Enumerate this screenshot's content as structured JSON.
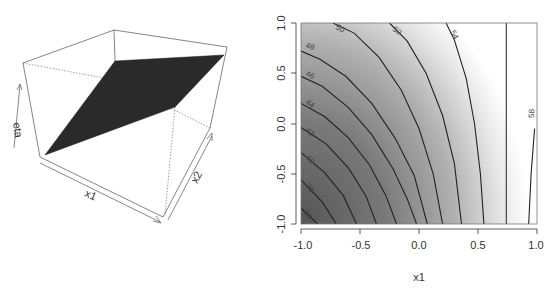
{
  "chart_data": [
    {
      "type": "surface3d",
      "title": "",
      "xlabel": "x1",
      "ylabel": "x2",
      "zlabel": "eta",
      "surface_color": "#2a2a2a",
      "description": "Planar surface eta over (x1, x2), perspective box view"
    },
    {
      "type": "contour",
      "title": "",
      "xlabel": "x1",
      "ylabel": "",
      "xlim": [
        -1.0,
        1.0
      ],
      "ylim": [
        -1.0,
        1.0
      ],
      "x_ticks": [
        "-1.0",
        "-0.5",
        "0.0",
        "0.5",
        "1.0"
      ],
      "y_ticks": [
        "-1.0",
        "-0.5",
        "0.0",
        "0.5",
        "1.0"
      ],
      "fill": "grayscale, dark (low) at bottom-left to white (high) toward right",
      "levels": [
        36,
        38,
        40,
        42,
        44,
        46,
        48,
        50,
        52,
        54,
        56,
        58
      ],
      "labeled_levels": [
        "36",
        "38",
        "40",
        "42",
        "44",
        "46",
        "48",
        "50",
        "52",
        "54",
        "58"
      ],
      "contours": [
        {
          "level": "36",
          "label": "36",
          "pts": [
            [
              -1.0,
              -0.84
            ],
            [
              -0.86,
              -1.0
            ]
          ]
        },
        {
          "level": "38",
          "label": "38",
          "pts": [
            [
              -1.0,
              -0.56
            ],
            [
              -0.82,
              -0.78
            ],
            [
              -0.7,
              -1.0
            ]
          ]
        },
        {
          "level": "40",
          "label": "40",
          "pts": [
            [
              -1.0,
              -0.29
            ],
            [
              -0.8,
              -0.49
            ],
            [
              -0.64,
              -0.72
            ],
            [
              -0.53,
              -1.0
            ]
          ]
        },
        {
          "level": "42",
          "label": "42",
          "pts": [
            [
              -1.0,
              -0.04
            ],
            [
              -0.79,
              -0.2
            ],
            [
              -0.6,
              -0.44
            ],
            [
              -0.45,
              -0.72
            ],
            [
              -0.36,
              -1.0
            ]
          ]
        },
        {
          "level": "44",
          "label": "44",
          "pts": [
            [
              -1.0,
              0.2
            ],
            [
              -0.8,
              0.07
            ],
            [
              -0.6,
              -0.14
            ],
            [
              -0.42,
              -0.41
            ],
            [
              -0.28,
              -0.72
            ],
            [
              -0.19,
              -1.0
            ]
          ]
        },
        {
          "level": "46",
          "label": "46",
          "pts": [
            [
              -1.0,
              0.47
            ],
            [
              -0.82,
              0.37
            ],
            [
              -0.6,
              0.16
            ],
            [
              -0.4,
              -0.11
            ],
            [
              -0.22,
              -0.45
            ],
            [
              -0.1,
              -0.75
            ],
            [
              -0.02,
              -1.0
            ]
          ]
        },
        {
          "level": "48",
          "label": "48",
          "pts": [
            [
              -1.0,
              0.72
            ],
            [
              -0.84,
              0.64
            ],
            [
              -0.62,
              0.47
            ],
            [
              -0.4,
              0.2
            ],
            [
              -0.2,
              -0.15
            ],
            [
              -0.04,
              -0.52
            ],
            [
              0.07,
              -1.0
            ]
          ]
        },
        {
          "level": "50",
          "label": "50",
          "pts": [
            [
              -0.73,
              1.0
            ],
            [
              -0.55,
              0.9
            ],
            [
              -0.34,
              0.66
            ],
            [
              -0.15,
              0.33
            ],
            [
              0.0,
              -0.05
            ],
            [
              0.12,
              -0.5
            ],
            [
              0.2,
              -1.0
            ]
          ]
        },
        {
          "level": "52",
          "label": "52",
          "pts": [
            [
              -0.25,
              1.0
            ],
            [
              -0.1,
              0.82
            ],
            [
              0.06,
              0.5
            ],
            [
              0.2,
              0.08
            ],
            [
              0.3,
              -0.4
            ],
            [
              0.36,
              -1.0
            ]
          ]
        },
        {
          "level": "54",
          "label": "54",
          "pts": [
            [
              0.23,
              1.0
            ],
            [
              0.3,
              0.83
            ],
            [
              0.4,
              0.45
            ],
            [
              0.47,
              0.0
            ],
            [
              0.52,
              -0.5
            ],
            [
              0.55,
              -1.0
            ]
          ]
        },
        {
          "level": "56",
          "label": "",
          "pts": [
            [
              0.74,
              1.0
            ],
            [
              0.74,
              -1.0
            ]
          ]
        },
        {
          "level": "58",
          "label": "58",
          "pts": [
            [
              0.98,
              -0.05
            ],
            [
              0.95,
              -0.5
            ],
            [
              0.93,
              -1.0
            ]
          ]
        }
      ]
    }
  ],
  "left_plot": {
    "axis_labels": {
      "x1": "x1",
      "x2": "x2",
      "eta": "eta"
    }
  },
  "right_plot": {
    "xlabel": "x1",
    "x_ticks": [
      "-1.0",
      "-0.5",
      "0.0",
      "0.5",
      "1.0"
    ],
    "y_ticks": [
      "-1.0",
      "-0.5",
      "0.0",
      "0.5",
      "1.0"
    ],
    "contour_labels": {
      "l36": "36",
      "l38": "38",
      "l40": "40",
      "l42": "42",
      "l44": "44",
      "l46": "46",
      "l48": "48",
      "l50": "50",
      "l52": "52",
      "l54": "54",
      "l58": "58"
    }
  }
}
